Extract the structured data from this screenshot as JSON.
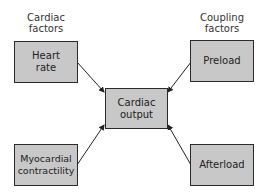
{
  "headers": {
    "left": "Cardiac\nfactors",
    "left_line1": "Cardiac",
    "left_line2": "factors",
    "right_line1": "Coupling",
    "right_line2": "factors"
  },
  "nodes": {
    "heart_rate": {
      "line1": "Heart",
      "line2": "rate"
    },
    "preload": {
      "line1": "Preload"
    },
    "cardiac_output": {
      "line1": "Cardiac",
      "line2": "output"
    },
    "myocardial_contractility": {
      "line1": "Myocardial",
      "line2": "contractility"
    },
    "afterload": {
      "line1": "Afterload"
    }
  },
  "edges": [
    {
      "from": "Heart rate",
      "to": "Cardiac output"
    },
    {
      "from": "Preload",
      "to": "Cardiac output"
    },
    {
      "from": "Myocardial contractility",
      "to": "Cardiac output"
    },
    {
      "from": "Afterload",
      "to": "Cardiac output"
    }
  ],
  "colors": {
    "box_fill": "#c8c8c8",
    "box_border": "#2a2a2a",
    "line": "#222222"
  }
}
